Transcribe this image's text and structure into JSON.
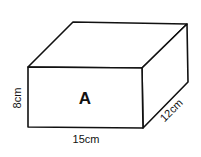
{
  "diagram": {
    "type": "rectangular-prism",
    "face_label": "A",
    "dimensions": {
      "height": "8cm",
      "width": "15cm",
      "depth": "12cm"
    },
    "stroke_color": "#111111",
    "background": "#ffffff"
  }
}
